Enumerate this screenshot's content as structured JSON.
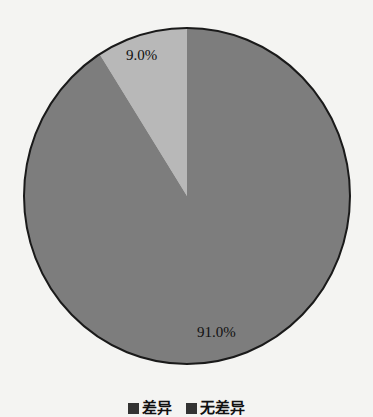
{
  "chart_data": {
    "type": "pie",
    "title": "",
    "slices": [
      {
        "label": "差异",
        "value": 9.0,
        "display": "9.0%",
        "color": "#b8b8b8"
      },
      {
        "label": "无差异",
        "value": 91.0,
        "display": "91.0%",
        "color": "#7d7d7d"
      }
    ],
    "start_angle_deg": 0,
    "direction": "counterclockwise",
    "legend_position": "bottom",
    "legend": [
      "差异",
      "无差异"
    ]
  },
  "labels": {
    "slice_small": "9.0%",
    "slice_large": "91.0%"
  },
  "legend": {
    "items": [
      {
        "label": "差异",
        "color": "#333333"
      },
      {
        "label": "无差异",
        "color": "#333333"
      }
    ]
  }
}
